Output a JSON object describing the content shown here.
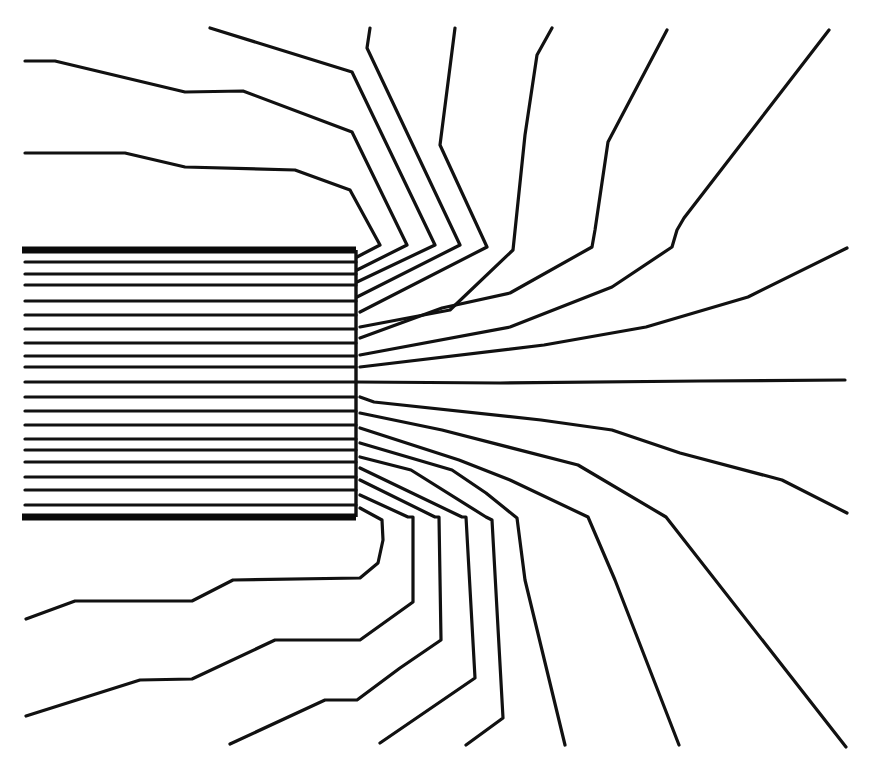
{
  "diagram": {
    "title": "",
    "colors": {
      "line": "#111111",
      "plate": "#0a0a0a",
      "background": "#ffffff"
    },
    "plates": {
      "x_start": 22,
      "x_end": 356,
      "top_y": 250,
      "bottom_y": 517
    },
    "edge_x": 356,
    "interior_lines_y": [
      262,
      274,
      285,
      301,
      315,
      329,
      343,
      356,
      367,
      382,
      397,
      411,
      425,
      439,
      450,
      462,
      477,
      490,
      505
    ],
    "field_lines": [
      {
        "id": "top-1",
        "points": [
          [
            25,
            153
          ],
          [
            125,
            153
          ],
          [
            185,
            167
          ],
          [
            295,
            170
          ],
          [
            350,
            190
          ],
          [
            380,
            245
          ],
          [
            357,
            257
          ]
        ]
      },
      {
        "id": "top-2",
        "points": [
          [
            25,
            61
          ],
          [
            55,
            61
          ],
          [
            185,
            92
          ],
          [
            243,
            91
          ],
          [
            352,
            132
          ],
          [
            407,
            245
          ],
          [
            357,
            270
          ]
        ]
      },
      {
        "id": "top-3",
        "points": [
          [
            210,
            28
          ],
          [
            352,
            72
          ],
          [
            435,
            245
          ],
          [
            357,
            282
          ]
        ]
      },
      {
        "id": "top-4",
        "points": [
          [
            370,
            28
          ],
          [
            367,
            48
          ],
          [
            460,
            245
          ],
          [
            357,
            297
          ]
        ]
      },
      {
        "id": "top-5",
        "points": [
          [
            455,
            28
          ],
          [
            440,
            145
          ],
          [
            487,
            247
          ],
          [
            360,
            312
          ]
        ]
      },
      {
        "id": "top-6",
        "points": [
          [
            552,
            28
          ],
          [
            537,
            55
          ],
          [
            525,
            135
          ],
          [
            513,
            250
          ],
          [
            450,
            310
          ],
          [
            360,
            327
          ]
        ]
      },
      {
        "id": "top-7",
        "points": [
          [
            667,
            30
          ],
          [
            608,
            142
          ],
          [
            595,
            230
          ],
          [
            592,
            247
          ],
          [
            510,
            293
          ],
          [
            442,
            308
          ],
          [
            360,
            338
          ]
        ]
      },
      {
        "id": "top-8",
        "points": [
          [
            829,
            30
          ],
          [
            684,
            218
          ],
          [
            677,
            230
          ],
          [
            672,
            247
          ],
          [
            612,
            287
          ],
          [
            510,
            327
          ],
          [
            360,
            355
          ]
        ]
      },
      {
        "id": "top-9",
        "points": [
          [
            847,
            248
          ],
          [
            748,
            297
          ],
          [
            646,
            327
          ],
          [
            544,
            345
          ],
          [
            360,
            367
          ]
        ]
      },
      {
        "id": "middle",
        "points": [
          [
            357,
            382
          ],
          [
            500,
            383
          ],
          [
            700,
            381
          ],
          [
            845,
            380
          ]
        ]
      },
      {
        "id": "bottom-9",
        "points": [
          [
            360,
            397
          ],
          [
            374,
            402
          ],
          [
            541,
            420
          ],
          [
            612,
            430
          ],
          [
            680,
            453
          ],
          [
            782,
            480
          ],
          [
            847,
            513
          ]
        ]
      },
      {
        "id": "bottom-8",
        "points": [
          [
            360,
            413
          ],
          [
            442,
            430
          ],
          [
            578,
            465
          ],
          [
            666,
            517
          ],
          [
            846,
            747
          ]
        ]
      },
      {
        "id": "bottom-7",
        "points": [
          [
            360,
            428
          ],
          [
            459,
            460
          ],
          [
            510,
            480
          ],
          [
            588,
            517
          ],
          [
            615,
            580
          ],
          [
            679,
            745
          ]
        ]
      },
      {
        "id": "bottom-6",
        "points": [
          [
            360,
            443
          ],
          [
            452,
            470
          ],
          [
            486,
            493
          ],
          [
            517,
            518
          ],
          [
            525,
            580
          ],
          [
            565,
            745
          ]
        ]
      },
      {
        "id": "bottom-5",
        "points": [
          [
            360,
            457
          ],
          [
            411,
            470
          ],
          [
            486,
            517
          ],
          [
            492,
            520
          ],
          [
            503,
            718
          ],
          [
            466,
            745
          ]
        ]
      },
      {
        "id": "bottom-4",
        "points": [
          [
            360,
            468
          ],
          [
            462,
            517
          ],
          [
            466,
            517
          ],
          [
            475,
            678
          ],
          [
            380,
            743
          ]
        ]
      },
      {
        "id": "bottom-3",
        "points": [
          [
            360,
            480
          ],
          [
            435,
            517
          ],
          [
            439,
            517
          ],
          [
            441,
            640
          ],
          [
            400,
            668
          ],
          [
            357,
            700
          ],
          [
            325,
            700
          ],
          [
            230,
            744
          ]
        ]
      },
      {
        "id": "bottom-2",
        "points": [
          [
            360,
            495
          ],
          [
            408,
            517
          ],
          [
            413,
            517
          ],
          [
            413,
            602
          ],
          [
            360,
            640
          ],
          [
            275,
            640
          ],
          [
            192,
            679
          ],
          [
            140,
            680
          ],
          [
            26,
            716
          ]
        ]
      },
      {
        "id": "bottom-1",
        "points": [
          [
            360,
            508
          ],
          [
            382,
            520
          ],
          [
            383,
            540
          ],
          [
            378,
            563
          ],
          [
            360,
            578
          ],
          [
            233,
            580
          ],
          [
            192,
            601
          ],
          [
            75,
            601
          ],
          [
            26,
            619
          ]
        ]
      }
    ]
  }
}
